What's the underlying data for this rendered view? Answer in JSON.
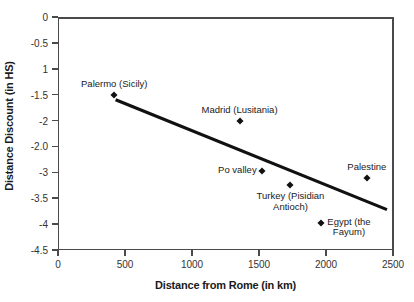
{
  "chart_data": {
    "type": "scatter",
    "title": "",
    "xlabel": "Distance from Rome (in km)",
    "ylabel": "Distance Discount (in HS)",
    "xlim": [
      0,
      2500
    ],
    "ylim": [
      -4.5,
      0
    ],
    "grid": false,
    "legend": "none",
    "x_ticks": [
      {
        "value": 0,
        "label": "0"
      },
      {
        "value": 500,
        "label": "500"
      },
      {
        "value": 1000,
        "label": "1000"
      },
      {
        "value": 1500,
        "label": "1500"
      },
      {
        "value": 2000,
        "label": "2000"
      },
      {
        "value": 2500,
        "label": "2500"
      }
    ],
    "y_ticks": [
      {
        "value": 0,
        "label": "0"
      },
      {
        "value": -0.5,
        "label": "-0.5"
      },
      {
        "value": -1.0,
        "label": "1"
      },
      {
        "value": -1.5,
        "label": "-1.5"
      },
      {
        "value": -2.0,
        "label": "-2"
      },
      {
        "value": -2.5,
        "label": "-2.0"
      },
      {
        "value": -3.0,
        "label": "-3"
      },
      {
        "value": -3.5,
        "label": "-3.5"
      },
      {
        "value": -4.0,
        "label": "-4"
      },
      {
        "value": -4.5,
        "label": "-4.5"
      }
    ],
    "points": [
      {
        "name": "Palermo (Sicily)",
        "label": "Palermo (Sicily)",
        "label_lines": [
          "Palermo (Sicily)"
        ],
        "x": 420,
        "y": -1.5,
        "label_pos": "above"
      },
      {
        "name": "Madrid (Lusitania)",
        "label": "Madrid (Lusitania)",
        "label_lines": [
          "Madrid (Lusitania)"
        ],
        "x": 1355,
        "y": -2.0,
        "label_pos": "above"
      },
      {
        "name": "Po valley",
        "label": "Po valley",
        "label_lines": [
          "Po valley"
        ],
        "x": 1520,
        "y": -2.97,
        "label_pos": "left"
      },
      {
        "name": "Turkey (Pisidian Antioch)",
        "label": "Turkey (Pisidian Antioch)",
        "label_lines": [
          "Turkey (Pisidian",
          "Antioch)"
        ],
        "x": 1735,
        "y": -3.25,
        "label_pos": "below"
      },
      {
        "name": "Egypt (the Fayum)",
        "label": "Egypt (the Fayum)",
        "label_lines": [
          "Egypt (the",
          "Fayum)"
        ],
        "x": 1965,
        "y": -3.97,
        "label_pos": "right"
      },
      {
        "name": "Palestine",
        "label": "Palestine",
        "label_lines": [
          "Palestine"
        ],
        "x": 2305,
        "y": -3.1,
        "label_pos": "above"
      }
    ],
    "trendline": {
      "type": "linear",
      "x_start": 430,
      "y_start": -1.6,
      "x_end": 2455,
      "y_end": -3.72
    },
    "colors": {
      "marker": "#111111",
      "trendline": "#111111",
      "axis": "#4a4a4a",
      "text": "#1a1a1a",
      "background": "#ffffff"
    }
  }
}
